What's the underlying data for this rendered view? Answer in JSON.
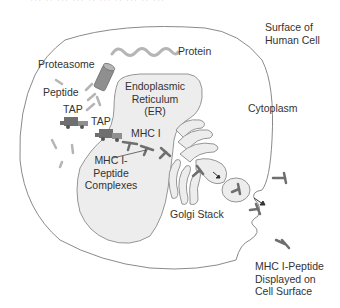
{
  "diagram": {
    "title_cutoff": "··· ·· ··· ··· ·· ··· ·· ··· ·· ···",
    "labels": {
      "surface_of_human_cell": [
        "Surface of",
        "Human Cell"
      ],
      "protein": "Protein",
      "proteasome": "Proteasome",
      "peptide": "Peptide",
      "tap_1": "TAP",
      "tap_2": "TAP",
      "er": [
        "Endoplasmic",
        "Reticulum",
        "(ER)"
      ],
      "mhc_i": "MHC I",
      "mhc_complexes": [
        "MHC I-",
        "Peptide",
        "Complexes"
      ],
      "cytoplasm": "Cytoplasm",
      "golgi_stack": "Golgi Stack",
      "mhc_displayed": [
        "MHC I-Peptide",
        "Displayed on",
        "Cell Surface"
      ]
    },
    "colors": {
      "outline": "#8a8a8a",
      "er_fill": "#ededed",
      "dark_gray": "#6f6f6f",
      "mid_gray": "#8f8f8f",
      "light_gray": "#b5b5b5",
      "text": "#333333"
    }
  }
}
